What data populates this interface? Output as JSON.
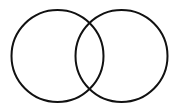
{
  "diagram": {
    "type": "venn",
    "background": "#ffffff",
    "stroke_color": "#111111",
    "stroke_width": 2,
    "circles": [
      {
        "id": "left",
        "cx": 57.5,
        "cy": 56,
        "r": 46
      },
      {
        "id": "right",
        "cx": 121.5,
        "cy": 56,
        "r": 46
      }
    ]
  }
}
